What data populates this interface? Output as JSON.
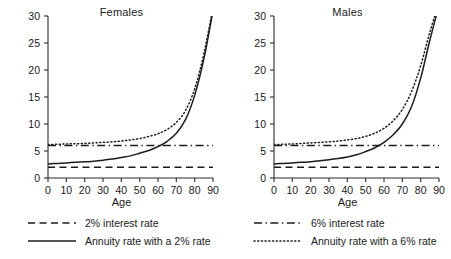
{
  "chart_data": [
    {
      "type": "line",
      "title": "Females",
      "xlabel": "Age",
      "ylabel": "",
      "xlim": [
        0,
        90
      ],
      "ylim": [
        0,
        30
      ],
      "xticks": [
        0,
        10,
        20,
        30,
        40,
        50,
        60,
        70,
        80,
        90
      ],
      "yticks": [
        0,
        5,
        10,
        15,
        20,
        25,
        30
      ],
      "grid": false,
      "legend_position": "below",
      "x": [
        0,
        5,
        10,
        15,
        20,
        25,
        30,
        35,
        40,
        45,
        50,
        55,
        60,
        65,
        70,
        75,
        80,
        85,
        90
      ],
      "series": [
        {
          "name": "2% interest rate",
          "style": "dashed",
          "values": [
            2.0,
            2.0,
            2.0,
            2.0,
            2.0,
            2.0,
            2.0,
            2.0,
            2.0,
            2.0,
            2.0,
            2.0,
            2.0,
            2.0,
            2.0,
            2.0,
            2.0,
            2.0,
            2.0
          ]
        },
        {
          "name": "6% interest rate",
          "style": "dashdot",
          "values": [
            6.0,
            6.0,
            6.0,
            6.0,
            6.0,
            6.0,
            6.0,
            6.0,
            6.0,
            6.0,
            6.0,
            6.0,
            6.0,
            6.0,
            6.0,
            6.0,
            6.0,
            6.0,
            6.0
          ]
        },
        {
          "name": "Annuity rate with a 2% rate",
          "style": "solid",
          "values": [
            2.6,
            2.7,
            2.8,
            2.9,
            3.0,
            3.1,
            3.3,
            3.5,
            3.8,
            4.1,
            4.6,
            5.1,
            5.8,
            6.8,
            8.3,
            10.8,
            15.3,
            22.0,
            31.0
          ]
        },
        {
          "name": "Annuity rate with a 6% rate",
          "style": "dotted",
          "values": [
            6.2,
            6.25,
            6.3,
            6.35,
            6.4,
            6.5,
            6.6,
            6.7,
            6.85,
            7.05,
            7.3,
            7.7,
            8.2,
            9.0,
            10.3,
            12.5,
            16.5,
            23.0,
            31.5
          ]
        }
      ]
    },
    {
      "type": "line",
      "title": "Males",
      "xlabel": "Age",
      "ylabel": "",
      "xlim": [
        0,
        90
      ],
      "ylim": [
        0,
        30
      ],
      "xticks": [
        0,
        10,
        20,
        30,
        40,
        50,
        60,
        70,
        80,
        90
      ],
      "yticks": [
        0,
        5,
        10,
        15,
        20,
        25,
        30
      ],
      "grid": false,
      "legend_position": "below",
      "x": [
        0,
        5,
        10,
        15,
        20,
        25,
        30,
        35,
        40,
        45,
        50,
        55,
        60,
        65,
        70,
        75,
        80,
        85,
        90
      ],
      "series": [
        {
          "name": "2% interest rate",
          "style": "dashed",
          "values": [
            2.0,
            2.0,
            2.0,
            2.0,
            2.0,
            2.0,
            2.0,
            2.0,
            2.0,
            2.0,
            2.0,
            2.0,
            2.0,
            2.0,
            2.0,
            2.0,
            2.0,
            2.0,
            2.0
          ]
        },
        {
          "name": "6% interest rate",
          "style": "dashdot",
          "values": [
            6.0,
            6.0,
            6.0,
            6.0,
            6.0,
            6.0,
            6.0,
            6.0,
            6.0,
            6.0,
            6.0,
            6.0,
            6.0,
            6.0,
            6.0,
            6.0,
            6.0,
            6.0,
            6.0
          ]
        },
        {
          "name": "Annuity rate with a 2% rate",
          "style": "solid",
          "values": [
            2.6,
            2.7,
            2.8,
            2.9,
            3.0,
            3.2,
            3.4,
            3.6,
            3.9,
            4.3,
            4.9,
            5.6,
            6.6,
            8.0,
            10.0,
            13.2,
            18.5,
            25.5,
            32.0
          ]
        },
        {
          "name": "Annuity rate with a 6% rate",
          "style": "dotted",
          "values": [
            6.2,
            6.25,
            6.3,
            6.4,
            6.5,
            6.6,
            6.7,
            6.85,
            7.05,
            7.3,
            7.7,
            8.3,
            9.2,
            10.6,
            12.7,
            16.0,
            20.8,
            27.0,
            32.5
          ]
        }
      ]
    }
  ],
  "panels": [
    {
      "title": "Females",
      "xlabel": "Age",
      "yticks": [
        "30",
        "25",
        "20",
        "15",
        "10",
        "5",
        "0"
      ],
      "xticks": [
        "0",
        "10",
        "20",
        "30",
        "40",
        "50",
        "60",
        "70",
        "80",
        "90"
      ],
      "legend": [
        {
          "label": "2% interest rate",
          "style": "dashed"
        },
        {
          "label": "Annuity rate with a 2% rate",
          "style": "solid"
        }
      ]
    },
    {
      "title": "Males",
      "xlabel": "Age",
      "yticks": [
        "30",
        "25",
        "20",
        "15",
        "10",
        "5",
        "0"
      ],
      "xticks": [
        "0",
        "10",
        "20",
        "30",
        "40",
        "50",
        "60",
        "70",
        "80",
        "90"
      ],
      "legend": [
        {
          "label": "6% interest rate",
          "style": "dashdot"
        },
        {
          "label": "Annuity rate with a 6% rate",
          "style": "dotted"
        }
      ]
    }
  ],
  "colors": {
    "ink": "#1c1c1c",
    "axis": "#2b2b2b",
    "background": "#ffffff"
  }
}
